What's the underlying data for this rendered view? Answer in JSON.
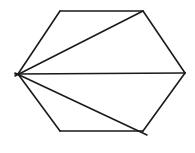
{
  "diagram": {
    "type": "hexagon-triangulation",
    "stroke_color": "#1a1a1a",
    "background": "#ffffff",
    "vertices": {
      "A": [
        18,
        74
      ],
      "B": [
        60,
        11
      ],
      "C": [
        143,
        11
      ],
      "D": [
        185,
        73
      ],
      "E": [
        143,
        131
      ],
      "F": [
        60,
        131
      ]
    },
    "sides": [
      [
        "A",
        "B"
      ],
      [
        "B",
        "C"
      ],
      [
        "C",
        "D"
      ],
      [
        "D",
        "E"
      ],
      [
        "E",
        "F"
      ],
      [
        "F",
        "A"
      ]
    ],
    "diagonals": [
      {
        "from": [
          15,
          76
        ],
        "to": [
          143,
          11
        ]
      },
      {
        "from": [
          15,
          74
        ],
        "to": [
          185,
          73
        ]
      },
      {
        "from": [
          15,
          73
        ],
        "to": [
          147,
          135
        ]
      }
    ]
  }
}
